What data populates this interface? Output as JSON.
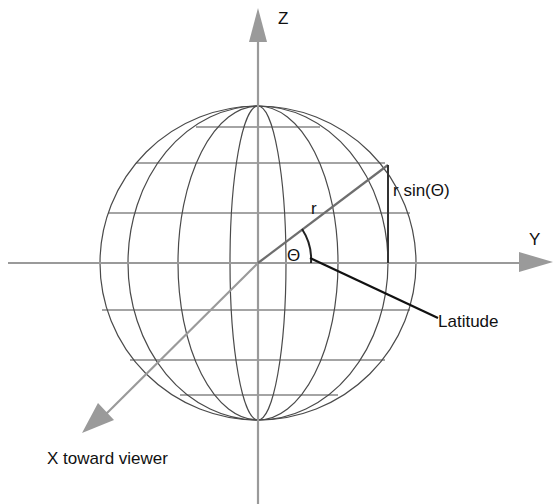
{
  "diagram": {
    "axes": {
      "z_label": "Z",
      "y_label": "Y",
      "x_label": "X toward viewer"
    },
    "labels": {
      "radius": "r",
      "angle": "Θ",
      "height": "r sin(Θ)",
      "latitude": "Latitude"
    },
    "colors": {
      "axis": "#9a9a9a",
      "grid": "#444444",
      "radius_line": "#7a7a7a",
      "text": "#111111",
      "background": "#ffffff"
    }
  }
}
